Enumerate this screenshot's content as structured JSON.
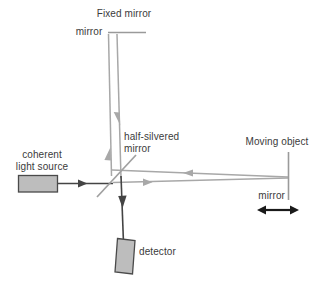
{
  "diagram": {
    "labels": {
      "fixed_mirror": "Fixed mirror",
      "top_mirror": "mirror",
      "half_silvered": "half-silvered\nmirror",
      "coherent_source": "coherent\nlight source",
      "moving_object": "Moving object",
      "right_mirror": "mirror",
      "detector": "detector"
    },
    "colors": {
      "beam_gray": "#a8a8a8",
      "beam_dark": "#444444",
      "text": "#3b3b3b",
      "box_fill": "#bdbdbd",
      "box_stroke": "#4a4a4a",
      "mirror_gray": "#a0a0a0",
      "background": "#ffffff"
    },
    "components": [
      {
        "name": "fixed-mirror",
        "kind": "mirror",
        "orientation": "horizontal"
      },
      {
        "name": "half-silvered-mirror",
        "kind": "beam-splitter",
        "orientation": "diagonal"
      },
      {
        "name": "coherent-light-source",
        "kind": "source",
        "orientation": "box"
      },
      {
        "name": "moving-object-mirror",
        "kind": "mirror",
        "orientation": "vertical"
      },
      {
        "name": "detector",
        "kind": "detector",
        "orientation": "box"
      },
      {
        "name": "motion-arrow",
        "kind": "double-arrow",
        "orientation": "horizontal"
      }
    ]
  }
}
